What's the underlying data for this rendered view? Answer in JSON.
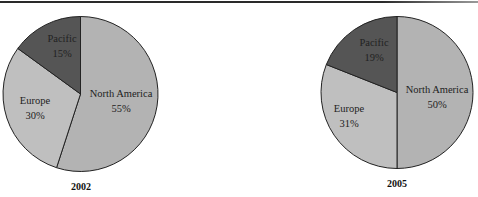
{
  "chart_data": [
    {
      "type": "pie",
      "title": "2002",
      "categories": [
        "North America",
        "Europe",
        "Pacific"
      ],
      "values": [
        55,
        30,
        15
      ],
      "labels": [
        "55%",
        "30%",
        "15%"
      ],
      "colors": [
        "#b3b3b3",
        "#bfbfbf",
        "#555555"
      ],
      "start_angle": "12 o'clock",
      "direction": "clockwise"
    },
    {
      "type": "pie",
      "title": "2005",
      "categories": [
        "North America",
        "Europe",
        "Pacific"
      ],
      "values": [
        50,
        31,
        19
      ],
      "labels": [
        "50%",
        "31%",
        "19%"
      ],
      "colors": [
        "#b3b3b3",
        "#bfbfbf",
        "#555555"
      ],
      "start_angle": "12 o'clock",
      "direction": "clockwise"
    }
  ],
  "charts": [
    {
      "year": "2002",
      "na": "North America",
      "na_pct": "55%",
      "eu": "Europe",
      "eu_pct": "30%",
      "pa": "Pacific",
      "pa_pct": "15%"
    },
    {
      "year": "2005",
      "na": "North America",
      "na_pct": "50%",
      "eu": "Europe",
      "eu_pct": "31%",
      "pa": "Pacific",
      "pa_pct": "19%"
    }
  ]
}
